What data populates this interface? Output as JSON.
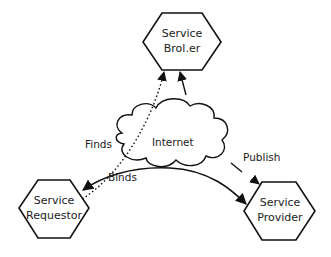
{
  "diagram": {
    "nodes": {
      "broker": {
        "line1": "Service",
        "line2": "Brol.er"
      },
      "requestor": {
        "line1": "Service",
        "line2": "Requestor"
      },
      "provider": {
        "line1": "Service",
        "line2": "Provider"
      },
      "cloud": {
        "label": "Internet"
      }
    },
    "edges": {
      "finds": {
        "label": "Finds",
        "style": "dotted"
      },
      "binds": {
        "label": "Binds",
        "style": "solid"
      },
      "publish": {
        "label": "Publish",
        "style": "solid"
      }
    },
    "colors": {
      "stroke": "#111111",
      "background": "#ffffff"
    }
  }
}
